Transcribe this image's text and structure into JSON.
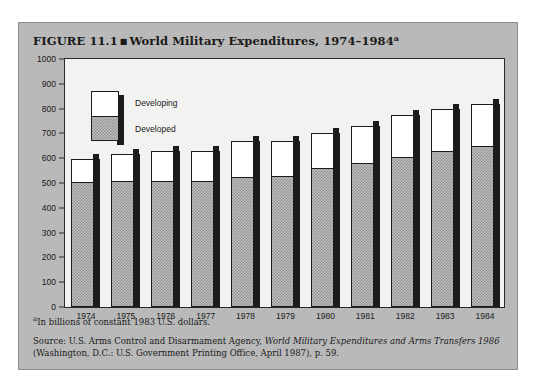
{
  "figure": {
    "number": "FIGURE 11.1",
    "bullet": "■",
    "title": "World Military Expenditures, 1974–1984",
    "title_superscript": "a"
  },
  "legend": {
    "developing_label": "Developing",
    "developed_label": "Developed"
  },
  "footnote": {
    "superscript": "a",
    "text": "In billions of constant 1983 U.S. dollars."
  },
  "source": {
    "line1_prefix": "Source: U.S. Arms Control and Disarmament Agency, ",
    "line1_italic": "World Military Expenditures and Arms Transfers 1986",
    "line2": "(Washington, D.C.: U.S. Government Printing Office, April 1987), p. 59."
  },
  "chart_data": {
    "type": "bar",
    "title": "World Military Expenditures, 1974–1984",
    "subtitle": "In billions of constant 1983 U.S. dollars",
    "xlabel": "",
    "ylabel": "",
    "ylim": [
      0,
      1000
    ],
    "yticks": [
      0,
      100,
      200,
      300,
      400,
      500,
      600,
      700,
      800,
      900,
      1000
    ],
    "grid": false,
    "stacked": true,
    "legend_position": "inside-top-left",
    "categories": [
      "1974",
      "1975",
      "1976",
      "1977",
      "1978",
      "1979",
      "1980",
      "1981",
      "1982",
      "1983",
      "1984"
    ],
    "series": [
      {
        "name": "Developed",
        "color": "#bdbdbd",
        "values": [
          500,
          505,
          505,
          505,
          520,
          525,
          555,
          575,
          600,
          625,
          645
        ]
      },
      {
        "name": "Developing",
        "color": "#ffffff",
        "values": [
          95,
          110,
          125,
          125,
          150,
          145,
          145,
          155,
          175,
          175,
          175
        ]
      }
    ],
    "totals": [
      595,
      615,
      630,
      630,
      670,
      670,
      700,
      730,
      775,
      800,
      820
    ]
  }
}
